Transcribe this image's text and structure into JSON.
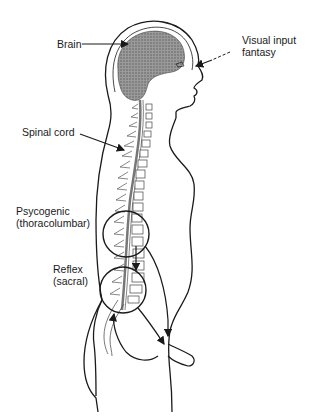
{
  "diagram": {
    "type": "anatomical-illustration",
    "labels": {
      "brain": "Brain",
      "visual_line1": "Visual input",
      "visual_line2": "fantasy",
      "spinal_cord": "Spinal cord",
      "psychogenic_line1": "Psycogenic",
      "psychogenic_line2": "(thoracolumbar)",
      "reflex_line1": "Reflex",
      "reflex_line2": "(sacral)"
    },
    "colors": {
      "line": "#1a1a1a",
      "brain_fill": "#8a8a8a",
      "background": "#ffffff"
    }
  }
}
